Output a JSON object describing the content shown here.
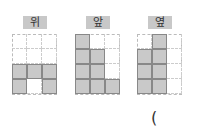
{
  "views": [
    {
      "label": "위",
      "cols": 3,
      "rows": 4,
      "filled": [
        [
          0,
          0,
          0
        ],
        [
          0,
          0,
          0
        ],
        [
          1,
          1,
          1
        ],
        [
          1,
          0,
          1
        ]
      ]
    },
    {
      "label": "앞",
      "cols": 3,
      "rows": 4,
      "filled": [
        [
          1,
          0,
          0
        ],
        [
          1,
          1,
          0
        ],
        [
          1,
          1,
          0
        ],
        [
          1,
          1,
          1
        ]
      ]
    },
    {
      "label": "옆",
      "cols": 3,
      "rows": 4,
      "filled": [
        [
          0,
          1,
          0
        ],
        [
          1,
          1,
          0
        ],
        [
          1,
          1,
          0
        ],
        [
          1,
          1,
          0
        ]
      ]
    }
  ],
  "answer_paren": "("
}
